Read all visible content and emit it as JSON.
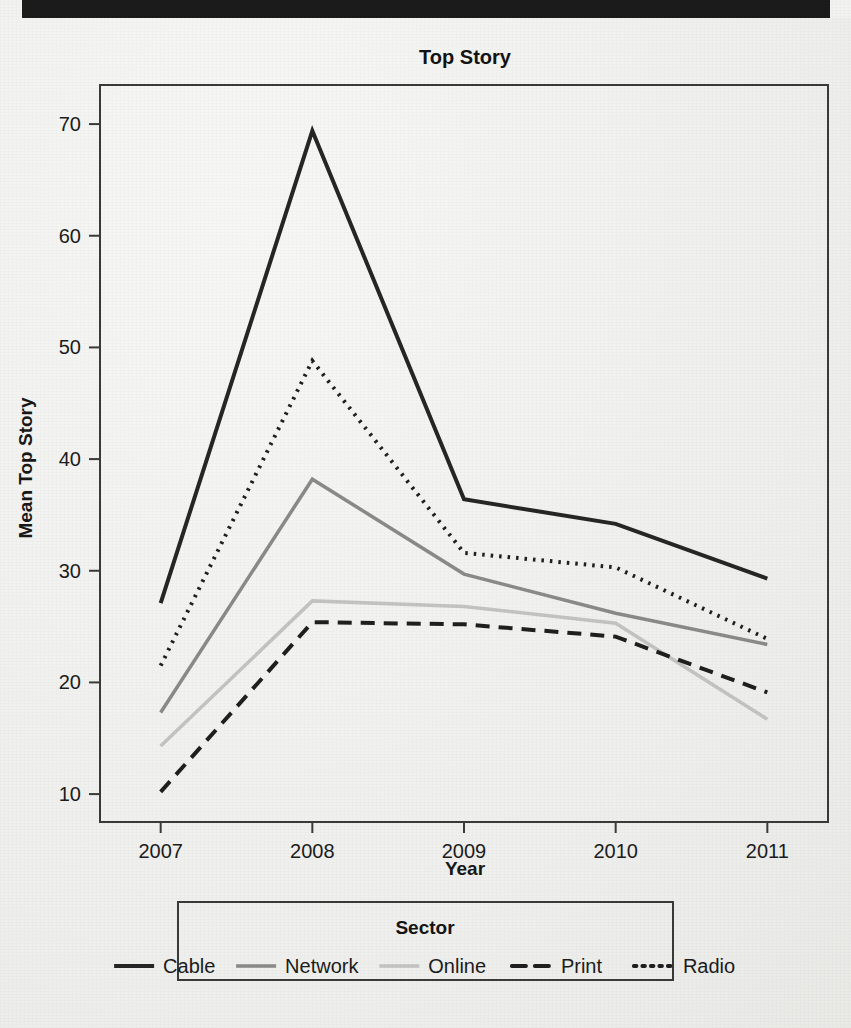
{
  "page": {
    "background_color": "#efefec",
    "header_bar_color": "#1b1b1b"
  },
  "chart_data": {
    "type": "line",
    "title": "Top Story",
    "xlabel": "Year",
    "ylabel": "Mean Top Story",
    "x": [
      2007,
      2008,
      2009,
      2010,
      2011
    ],
    "xtick_labels": [
      "2007",
      "2008",
      "2009",
      "2010",
      "2011"
    ],
    "ytick_labels": [
      "10",
      "20",
      "30",
      "40",
      "50",
      "60",
      "70"
    ],
    "yticks": [
      10,
      20,
      30,
      40,
      50,
      60,
      70
    ],
    "ylim": [
      7.5,
      73.5
    ],
    "xlim": [
      2006.6,
      2011.4
    ],
    "grid": false,
    "legend_title": "Sector",
    "legend_position": "bottom",
    "series": [
      {
        "name": "Cable",
        "values": [
          27.1,
          69.4,
          36.4,
          34.2,
          29.3
        ],
        "color": "#262626",
        "dash": "none",
        "width": 4
      },
      {
        "name": "Network",
        "values": [
          17.3,
          38.2,
          29.7,
          26.2,
          23.4
        ],
        "color": "#8a8a8a",
        "dash": "none",
        "width": 3.5
      },
      {
        "name": "Online",
        "values": [
          14.3,
          27.3,
          26.8,
          25.3,
          16.7
        ],
        "color": "#c3c3c3",
        "dash": "none",
        "width": 3.5
      },
      {
        "name": "Print",
        "values": [
          10.2,
          25.4,
          25.2,
          24.1,
          19.1
        ],
        "color": "#1f1f1f",
        "dash": "14 9",
        "width": 4
      },
      {
        "name": "Radio",
        "values": [
          21.5,
          48.8,
          31.6,
          30.3,
          23.9
        ],
        "color": "#1f1f1f",
        "dash": "2.5 6",
        "width": 4
      }
    ]
  }
}
